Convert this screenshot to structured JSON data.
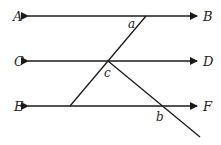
{
  "diagram": {
    "points": {
      "A": "A",
      "B": "B",
      "C": "C",
      "D": "D",
      "E": "E",
      "F": "F"
    },
    "angles": {
      "a": "a",
      "b": "b",
      "c": "c"
    },
    "line_color": "#1a1a1a"
  }
}
